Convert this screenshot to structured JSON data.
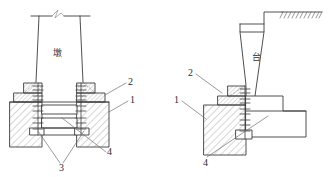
{
  "figure": {
    "title_visible": false,
    "background_color": "#ffffff",
    "line_color": "#3c3c3c",
    "hatch_color": "#8a8a8a",
    "text_color": "#2b2b2b"
  },
  "left_view": {
    "name": "pier-section",
    "body_label": "墩",
    "break_symbol": "zigzag-break",
    "callouts": [
      {
        "id": "1",
        "label": "1"
      },
      {
        "id": "2",
        "label": "2"
      },
      {
        "id": "3",
        "label": "3"
      },
      {
        "id": "4",
        "label": "4"
      }
    ]
  },
  "right_view": {
    "name": "abutment-section",
    "body_label": "台",
    "ground_symbol": "ground-hatch-line",
    "callouts": [
      {
        "id": "1",
        "label": "1"
      },
      {
        "id": "2",
        "label": "2"
      },
      {
        "id": "4",
        "label": "4"
      }
    ]
  },
  "labels": {
    "left_pier": "墩",
    "right_abutment": "台",
    "left_1": "1",
    "left_2": "2",
    "left_3": "3",
    "left_4": "4",
    "right_1": "1",
    "right_2": "2",
    "right_4": "4"
  }
}
